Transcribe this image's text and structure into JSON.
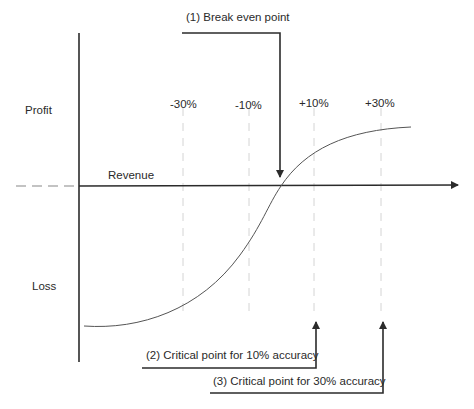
{
  "diagram": {
    "y_axis": {
      "top_label": "Profit",
      "bottom_label": "Loss"
    },
    "x_axis": {
      "label": "Revenue"
    },
    "accuracy_markers": [
      {
        "label": "-30%",
        "x": 183
      },
      {
        "label": "-10%",
        "x": 249
      },
      {
        "label": "+10%",
        "x": 314
      },
      {
        "label": "+30%",
        "x": 381
      }
    ],
    "callouts": [
      {
        "id": 1,
        "label": "(1) Break even point"
      },
      {
        "id": 2,
        "label": "(2) Critical point for 10% accuracy"
      },
      {
        "id": 3,
        "label": "(3) Critical point for 30% accuracy"
      }
    ],
    "colors": {
      "axis": "#2b2b2b",
      "curve": "#555555",
      "dashed": "#cfcfcf",
      "text": "#2a2a2a"
    }
  }
}
